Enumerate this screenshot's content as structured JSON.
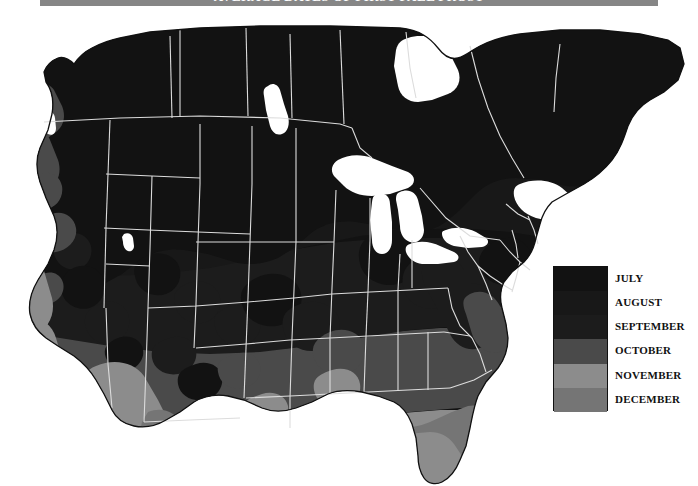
{
  "title": {
    "text": "AVERAGE DATES OF FIRST FALL FROST"
  },
  "legend": {
    "name": "frost-date-legend",
    "items": [
      {
        "label": "JULY",
        "color": "#121212"
      },
      {
        "label": "AUGUST",
        "color": "#181818"
      },
      {
        "label": "SEPTEMBER",
        "color": "#1c1c1c"
      },
      {
        "label": "OCTOBER",
        "color": "#4a4a4a"
      },
      {
        "label": "NOVEMBER",
        "color": "#8c8c8c"
      },
      {
        "label": "DECEMBER",
        "color": "#757575"
      }
    ]
  },
  "map": {
    "name": "north-america-first-frost-map",
    "description": "Shaded map of the contiguous United States and southern Canada showing average dates of first fall frost",
    "background": "#ffffff",
    "border_color": "#d8d8d8",
    "outline_color": "#111111",
    "water_color": "#ffffff",
    "title_band_color": "#868686",
    "regions": [
      {
        "name": "canada-and-northern-plains",
        "month": "JULY",
        "color": "#121212"
      },
      {
        "name": "northern-rockies",
        "month": "AUGUST",
        "color": "#181818"
      },
      {
        "name": "upper-midwest-northeast",
        "month": "SEPTEMBER",
        "color": "#1c1c1c"
      },
      {
        "name": "mid-atlantic-ohio-valley",
        "month": "OCTOBER",
        "color": "#4a4a4a"
      },
      {
        "name": "deep-south-southwest",
        "month": "NOVEMBER",
        "color": "#8c8c8c"
      },
      {
        "name": "gulf-coast-florida",
        "month": "DECEMBER",
        "color": "#757575"
      }
    ],
    "water_features": [
      {
        "name": "great-lakes"
      },
      {
        "name": "hudson-bay"
      },
      {
        "name": "great-salt-lake"
      },
      {
        "name": "lake-winnipeg"
      },
      {
        "name": "puget-sound"
      },
      {
        "name": "chesapeake-bay"
      },
      {
        "name": "gulf-of-mexico"
      },
      {
        "name": "atlantic-ocean"
      },
      {
        "name": "pacific-ocean"
      }
    ]
  }
}
